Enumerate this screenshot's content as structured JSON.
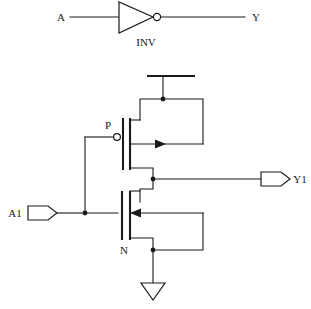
{
  "diagram": {
    "background_color": "#ffffff",
    "line_color": "#1a1a1a"
  },
  "symbol_view": {
    "name": "inverter-symbol",
    "input_label": "A",
    "output_label": "Y",
    "gate_label": "INV",
    "bubble": "inversion-bubble"
  },
  "transistor_view": {
    "name": "cmos-inverter-schematic",
    "input_port_label": "A1",
    "output_port_label": "Y1",
    "pmos_label": "P",
    "nmos_label": "N",
    "supply_symbol": "vdd-rail",
    "ground_symbol": "gnd-triangle"
  }
}
